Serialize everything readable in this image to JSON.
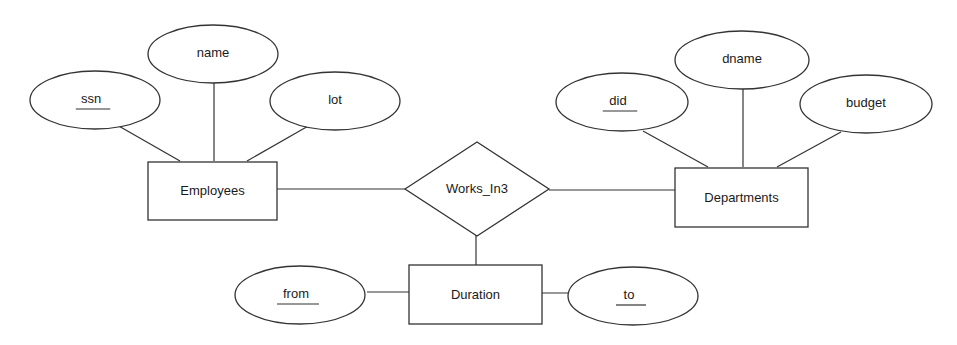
{
  "diagram": {
    "type": "ER diagram",
    "entities": [
      {
        "id": "employees",
        "label": "Employees",
        "x": 148,
        "y": 162,
        "w": 129,
        "h": 58
      },
      {
        "id": "departments",
        "label": "Departments",
        "x": 675,
        "y": 168,
        "w": 133,
        "h": 59
      },
      {
        "id": "duration",
        "label": "Duration",
        "x": 409,
        "y": 265,
        "w": 133,
        "h": 59
      }
    ],
    "relationships": [
      {
        "id": "works_in3",
        "label": "Works_In3",
        "cx": 477,
        "cy": 189,
        "halfw": 72,
        "halfh": 47
      }
    ],
    "attributes": [
      {
        "id": "ssn",
        "label": "ssn",
        "key": true,
        "cx": 95,
        "cy": 100,
        "rx": 65,
        "ry": 29,
        "owner": "employees"
      },
      {
        "id": "name",
        "label": "name",
        "key": false,
        "cx": 213,
        "cy": 54,
        "rx": 65,
        "ry": 29,
        "owner": "employees"
      },
      {
        "id": "lot",
        "label": "lot",
        "key": false,
        "cx": 335,
        "cy": 101,
        "rx": 65,
        "ry": 29,
        "owner": "employees"
      },
      {
        "id": "did",
        "label": "did",
        "key": true,
        "cx": 622,
        "cy": 102,
        "rx": 66,
        "ry": 29,
        "owner": "departments"
      },
      {
        "id": "dname",
        "label": "dname",
        "key": false,
        "cx": 742,
        "cy": 60,
        "rx": 67,
        "ry": 29,
        "owner": "departments"
      },
      {
        "id": "budget",
        "label": "budget",
        "key": false,
        "cx": 866,
        "cy": 104,
        "rx": 66,
        "ry": 29,
        "owner": "departments"
      },
      {
        "id": "from",
        "label": "from",
        "key": true,
        "cx": 300,
        "cy": 295,
        "rx": 65,
        "ry": 29,
        "owner": "duration"
      },
      {
        "id": "to",
        "label": "to",
        "key": true,
        "cx": 633,
        "cy": 296,
        "rx": 65,
        "ry": 29,
        "owner": "duration"
      }
    ],
    "edges": [
      {
        "from": "ssn",
        "to": "employees",
        "x1": 117,
        "y1": 125,
        "x2": 180,
        "y2": 161
      },
      {
        "from": "name",
        "to": "employees",
        "x1": 214,
        "y1": 83,
        "x2": 214,
        "y2": 161
      },
      {
        "from": "lot",
        "to": "employees",
        "x1": 310,
        "y1": 125,
        "x2": 247,
        "y2": 161
      },
      {
        "from": "employees",
        "to": "works_in3",
        "x1": 277,
        "y1": 189,
        "x2": 405,
        "y2": 189
      },
      {
        "from": "works_in3",
        "to": "departments",
        "x1": 549,
        "y1": 190,
        "x2": 675,
        "y2": 190
      },
      {
        "from": "works_in3",
        "to": "duration",
        "x1": 476,
        "y1": 235,
        "x2": 476,
        "y2": 265
      },
      {
        "from": "did",
        "to": "departments",
        "x1": 643,
        "y1": 131,
        "x2": 708,
        "y2": 167
      },
      {
        "from": "dname",
        "to": "departments",
        "x1": 743,
        "y1": 89,
        "x2": 743,
        "y2": 167
      },
      {
        "from": "budget",
        "to": "departments",
        "x1": 841,
        "y1": 132,
        "x2": 777,
        "y2": 167
      },
      {
        "from": "from",
        "to": "duration",
        "x1": 367,
        "y1": 292,
        "x2": 409,
        "y2": 292
      },
      {
        "from": "duration",
        "to": "to",
        "x1": 542,
        "y1": 293,
        "x2": 583,
        "y2": 293
      }
    ]
  }
}
